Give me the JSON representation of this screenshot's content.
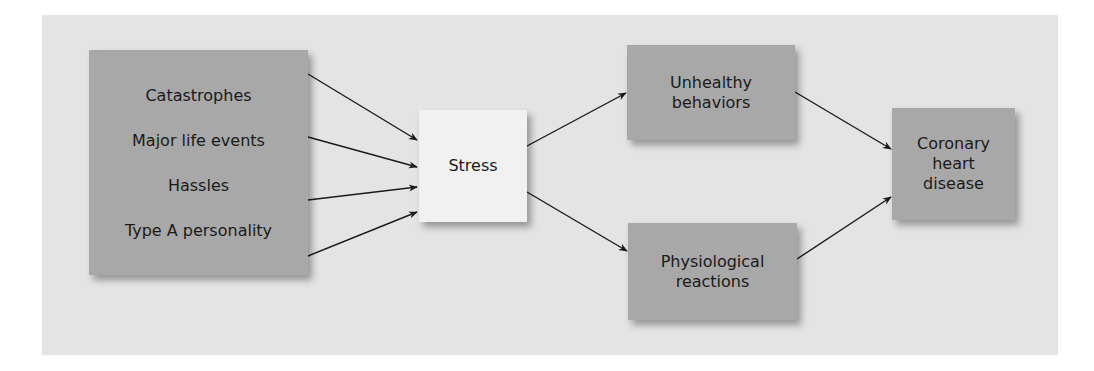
{
  "diagram": {
    "sources": {
      "items": [
        "Catastrophes",
        "Major life events",
        "Hassles",
        "Type A personality"
      ]
    },
    "stress": {
      "label": "Stress"
    },
    "unhealthy": {
      "line1": "Unhealthy",
      "line2": "behaviors"
    },
    "physiological": {
      "line1": "Physiological",
      "line2": "reactions"
    },
    "outcome": {
      "line1": "Coronary",
      "line2": "heart",
      "line3": "disease"
    },
    "edges": [
      {
        "from": "Catastrophes",
        "to": "Stress"
      },
      {
        "from": "Major life events",
        "to": "Stress"
      },
      {
        "from": "Hassles",
        "to": "Stress"
      },
      {
        "from": "Type A personality",
        "to": "Stress"
      },
      {
        "from": "Stress",
        "to": "Unhealthy behaviors"
      },
      {
        "from": "Stress",
        "to": "Physiological reactions"
      },
      {
        "from": "Unhealthy behaviors",
        "to": "Coronary heart disease"
      },
      {
        "from": "Physiological reactions",
        "to": "Coronary heart disease"
      }
    ],
    "colors": {
      "panel": "#e4e4e4",
      "box_dark": "#a8a8a8",
      "box_light": "#f1f1f1",
      "arrow": "#1a1a1a"
    }
  }
}
